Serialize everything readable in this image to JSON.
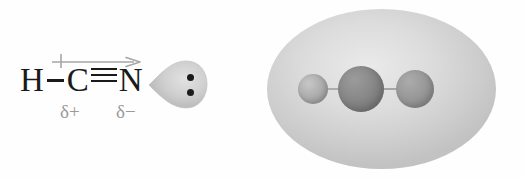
{
  "figure": {
    "background_color": "#fefefe"
  },
  "lewis_structure": {
    "label": "HCN Lewis structure with dipole",
    "atoms": [
      {
        "symbol": "H",
        "name": "hydrogen-atom"
      },
      {
        "symbol": "C",
        "name": "carbon-atom"
      },
      {
        "symbol": "N",
        "name": "nitrogen-atom"
      }
    ],
    "bonds": [
      {
        "type": "single",
        "between": "H-C",
        "symbol": "—"
      },
      {
        "type": "triple",
        "between": "C-N",
        "symbol": "≡"
      }
    ],
    "dipole_arrow": {
      "label": "dipole moment vector",
      "direction": "left-to-right",
      "tail_marker": "+",
      "color": "#a6a6a6"
    },
    "partial_charges": [
      {
        "id": "delta-plus",
        "text": "δ+",
        "on_atom": "C",
        "color": "#9a9a9a"
      },
      {
        "id": "delta-minus",
        "text": "δ−",
        "on_atom": "N",
        "color": "#9a9a9a"
      }
    ],
    "lone_pair": {
      "label": "nitrogen lone pair lobe",
      "dot_count": 2,
      "lobe_color": "#c9c9c9",
      "dot_color": "#1b1b1b"
    }
  },
  "space_filling_model": {
    "label": "HCN electron density surface with atoms",
    "electron_cloud": {
      "shape": "ellipse",
      "color": "#cfcfcf"
    },
    "spheres": [
      {
        "id": "sphere-h",
        "atom": "H",
        "size": "small",
        "color": "#b0b0b0"
      },
      {
        "id": "sphere-c",
        "atom": "C",
        "size": "large",
        "color": "#8a8a8a"
      },
      {
        "id": "sphere-n",
        "atom": "N",
        "size": "medium",
        "color": "#9a9a9a"
      }
    ],
    "bond_axis": "horizontal"
  }
}
